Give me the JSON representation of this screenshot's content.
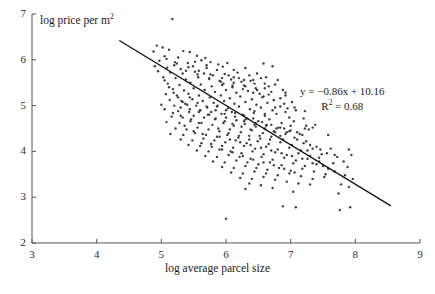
{
  "chart_data": {
    "type": "scatter",
    "title": "",
    "xlabel": "log average parcel size",
    "ylabel": "log price per m2",
    "ylabel_base": "log price per m",
    "ylabel_sup": "2",
    "xlim": [
      3,
      9
    ],
    "ylim": [
      2,
      7
    ],
    "xticks": [
      3,
      4,
      5,
      6,
      7,
      8,
      9
    ],
    "yticks": [
      2,
      3,
      4,
      5,
      6,
      7
    ],
    "grid": false,
    "legend": null,
    "marker_color": "#3e3e46",
    "marker_size_px": 2.4,
    "line_color": "#111111",
    "axis_color": "#555555",
    "annotations": {
      "equation": "y = −0.86x + 10.16",
      "r_squared_base": "R",
      "r_squared_sup": "2",
      "r_squared_value": " = 0.68",
      "slope": -0.86,
      "intercept": 10.16,
      "r2": 0.68
    },
    "fit_line": {
      "x_start": 4.35,
      "y_start": 6.42,
      "x_end": 8.55,
      "y_end": 2.81
    },
    "points": [
      [
        5.17,
        6.89
      ],
      [
        4.93,
        6.31
      ],
      [
        5.02,
        6.27
      ],
      [
        5.12,
        6.22
      ],
      [
        4.88,
        6.18
      ],
      [
        5.34,
        6.19
      ],
      [
        5.44,
        6.17
      ],
      [
        5.05,
        6.08
      ],
      [
        5.26,
        6.05
      ],
      [
        5.55,
        6.09
      ],
      [
        5.68,
        6.04
      ],
      [
        4.97,
        5.98
      ],
      [
        5.21,
        5.95
      ],
      [
        5.41,
        5.93
      ],
      [
        5.62,
        5.99
      ],
      [
        5.76,
        5.95
      ],
      [
        5.88,
        5.9
      ],
      [
        6.02,
        5.93
      ],
      [
        4.9,
        5.86
      ],
      [
        5.09,
        5.83
      ],
      [
        5.3,
        5.8
      ],
      [
        5.49,
        5.86
      ],
      [
        5.7,
        5.82
      ],
      [
        5.95,
        5.85
      ],
      [
        6.12,
        5.78
      ],
      [
        6.3,
        5.82
      ],
      [
        6.58,
        5.92
      ],
      [
        6.72,
        5.86
      ],
      [
        4.95,
        5.75
      ],
      [
        5.14,
        5.72
      ],
      [
        5.33,
        5.7
      ],
      [
        5.52,
        5.74
      ],
      [
        5.66,
        5.7
      ],
      [
        5.8,
        5.66
      ],
      [
        5.98,
        5.69
      ],
      [
        6.18,
        5.72
      ],
      [
        6.36,
        5.66
      ],
      [
        6.48,
        5.7
      ],
      [
        6.62,
        5.62
      ],
      [
        5.03,
        5.62
      ],
      [
        5.22,
        5.6
      ],
      [
        5.38,
        5.57
      ],
      [
        5.57,
        5.62
      ],
      [
        5.74,
        5.58
      ],
      [
        5.9,
        5.54
      ],
      [
        6.08,
        5.57
      ],
      [
        6.24,
        5.52
      ],
      [
        6.42,
        5.56
      ],
      [
        6.6,
        5.48
      ],
      [
        6.8,
        5.56
      ],
      [
        5.1,
        5.48
      ],
      [
        5.28,
        5.45
      ],
      [
        5.45,
        5.5
      ],
      [
        5.61,
        5.46
      ],
      [
        5.78,
        5.42
      ],
      [
        5.94,
        5.45
      ],
      [
        6.1,
        5.4
      ],
      [
        6.28,
        5.44
      ],
      [
        6.46,
        5.38
      ],
      [
        6.66,
        5.42
      ],
      [
        6.88,
        5.34
      ],
      [
        5.18,
        5.36
      ],
      [
        5.35,
        5.33
      ],
      [
        5.5,
        5.38
      ],
      [
        5.67,
        5.34
      ],
      [
        5.83,
        5.3
      ],
      [
        6.0,
        5.34
      ],
      [
        6.16,
        5.28
      ],
      [
        6.34,
        5.32
      ],
      [
        6.52,
        5.26
      ],
      [
        6.7,
        5.3
      ],
      [
        6.92,
        5.22
      ],
      [
        5.07,
        5.25
      ],
      [
        5.24,
        5.22
      ],
      [
        5.42,
        5.26
      ],
      [
        5.58,
        5.22
      ],
      [
        5.75,
        5.18
      ],
      [
        5.92,
        5.22
      ],
      [
        6.06,
        5.16
      ],
      [
        6.22,
        5.2
      ],
      [
        6.4,
        5.14
      ],
      [
        6.56,
        5.18
      ],
      [
        6.74,
        5.12
      ],
      [
        5.13,
        5.12
      ],
      [
        5.31,
        5.1
      ],
      [
        5.48,
        5.14
      ],
      [
        5.64,
        5.1
      ],
      [
        5.81,
        5.06
      ],
      [
        5.97,
        5.1
      ],
      [
        6.13,
        5.04
      ],
      [
        6.3,
        5.08
      ],
      [
        6.47,
        5.02
      ],
      [
        6.64,
        5.06
      ],
      [
        6.84,
        4.98
      ],
      [
        5.0,
        5.02
      ],
      [
        5.2,
        5.0
      ],
      [
        5.37,
        5.04
      ],
      [
        5.54,
        5.0
      ],
      [
        5.71,
        4.96
      ],
      [
        5.87,
        5.0
      ],
      [
        6.03,
        4.94
      ],
      [
        6.2,
        4.98
      ],
      [
        6.37,
        4.92
      ],
      [
        6.54,
        4.96
      ],
      [
        6.72,
        4.9
      ],
      [
        6.95,
        4.94
      ],
      [
        5.26,
        4.88
      ],
      [
        5.43,
        4.86
      ],
      [
        5.6,
        4.9
      ],
      [
        5.77,
        4.86
      ],
      [
        5.93,
        4.82
      ],
      [
        6.09,
        4.86
      ],
      [
        6.26,
        4.8
      ],
      [
        6.43,
        4.84
      ],
      [
        6.6,
        4.78
      ],
      [
        6.78,
        4.82
      ],
      [
        6.98,
        4.74
      ],
      [
        5.16,
        4.76
      ],
      [
        5.33,
        4.74
      ],
      [
        5.5,
        4.78
      ],
      [
        5.66,
        4.74
      ],
      [
        5.83,
        4.7
      ],
      [
        6.0,
        4.74
      ],
      [
        6.16,
        4.68
      ],
      [
        6.33,
        4.72
      ],
      [
        6.5,
        4.66
      ],
      [
        6.67,
        4.7
      ],
      [
        6.86,
        4.62
      ],
      [
        7.05,
        4.66
      ],
      [
        5.08,
        4.64
      ],
      [
        5.28,
        4.62
      ],
      [
        5.45,
        4.66
      ],
      [
        5.62,
        4.62
      ],
      [
        5.79,
        4.58
      ],
      [
        5.96,
        4.62
      ],
      [
        6.12,
        4.56
      ],
      [
        6.29,
        4.6
      ],
      [
        6.46,
        4.54
      ],
      [
        6.63,
        4.58
      ],
      [
        6.81,
        4.52
      ],
      [
        7.0,
        4.56
      ],
      [
        7.22,
        4.5
      ],
      [
        7.34,
        4.52
      ],
      [
        5.22,
        4.5
      ],
      [
        5.39,
        4.48
      ],
      [
        5.56,
        4.52
      ],
      [
        5.73,
        4.48
      ],
      [
        5.9,
        4.44
      ],
      [
        6.06,
        4.48
      ],
      [
        6.23,
        4.42
      ],
      [
        6.4,
        4.46
      ],
      [
        6.57,
        4.4
      ],
      [
        6.74,
        4.44
      ],
      [
        6.92,
        4.38
      ],
      [
        7.1,
        4.42
      ],
      [
        7.28,
        4.48
      ],
      [
        5.14,
        4.38
      ],
      [
        5.34,
        4.36
      ],
      [
        5.52,
        4.4
      ],
      [
        5.69,
        4.36
      ],
      [
        5.86,
        4.32
      ],
      [
        6.02,
        4.36
      ],
      [
        6.19,
        4.3
      ],
      [
        6.36,
        4.34
      ],
      [
        6.53,
        4.28
      ],
      [
        6.7,
        4.32
      ],
      [
        6.88,
        4.26
      ],
      [
        7.06,
        4.3
      ],
      [
        7.24,
        4.22
      ],
      [
        7.58,
        4.36
      ],
      [
        5.3,
        4.26
      ],
      [
        5.48,
        4.24
      ],
      [
        5.65,
        4.28
      ],
      [
        5.82,
        4.24
      ],
      [
        5.99,
        4.2
      ],
      [
        6.15,
        4.24
      ],
      [
        6.32,
        4.18
      ],
      [
        6.49,
        4.22
      ],
      [
        6.66,
        4.16
      ],
      [
        6.84,
        4.2
      ],
      [
        7.02,
        4.14
      ],
      [
        7.2,
        4.18
      ],
      [
        7.4,
        4.1
      ],
      [
        7.62,
        4.06
      ],
      [
        7.9,
        4.04
      ],
      [
        5.42,
        4.14
      ],
      [
        5.6,
        4.12
      ],
      [
        5.77,
        4.16
      ],
      [
        5.94,
        4.12
      ],
      [
        6.11,
        4.08
      ],
      [
        6.28,
        4.12
      ],
      [
        6.45,
        4.06
      ],
      [
        6.62,
        4.1
      ],
      [
        6.8,
        4.04
      ],
      [
        6.98,
        4.08
      ],
      [
        7.16,
        4.02
      ],
      [
        7.34,
        4.06
      ],
      [
        7.56,
        3.96
      ],
      [
        5.55,
        4.02
      ],
      [
        5.73,
        4.0
      ],
      [
        5.9,
        4.04
      ],
      [
        6.07,
        4.0
      ],
      [
        6.24,
        3.96
      ],
      [
        6.41,
        4.0
      ],
      [
        6.58,
        3.94
      ],
      [
        6.76,
        3.98
      ],
      [
        6.94,
        3.92
      ],
      [
        7.12,
        3.96
      ],
      [
        7.3,
        3.9
      ],
      [
        7.48,
        3.94
      ],
      [
        7.72,
        3.88
      ],
      [
        7.94,
        3.92
      ],
      [
        5.68,
        3.9
      ],
      [
        5.86,
        3.88
      ],
      [
        6.04,
        3.92
      ],
      [
        6.21,
        3.88
      ],
      [
        6.38,
        3.84
      ],
      [
        6.55,
        3.88
      ],
      [
        6.72,
        3.82
      ],
      [
        6.9,
        3.86
      ],
      [
        7.08,
        3.8
      ],
      [
        7.26,
        3.84
      ],
      [
        7.44,
        3.78
      ],
      [
        7.66,
        3.74
      ],
      [
        5.8,
        3.78
      ],
      [
        5.98,
        3.76
      ],
      [
        6.16,
        3.8
      ],
      [
        6.33,
        3.76
      ],
      [
        6.5,
        3.72
      ],
      [
        6.68,
        3.76
      ],
      [
        6.86,
        3.7
      ],
      [
        7.04,
        3.74
      ],
      [
        7.22,
        3.68
      ],
      [
        7.4,
        3.72
      ],
      [
        7.58,
        3.62
      ],
      [
        7.88,
        3.66
      ],
      [
        5.94,
        3.66
      ],
      [
        6.12,
        3.64
      ],
      [
        6.3,
        3.68
      ],
      [
        6.47,
        3.64
      ],
      [
        6.64,
        3.6
      ],
      [
        6.82,
        3.64
      ],
      [
        7.0,
        3.58
      ],
      [
        7.18,
        3.62
      ],
      [
        7.36,
        3.56
      ],
      [
        7.54,
        3.5
      ],
      [
        6.08,
        3.54
      ],
      [
        6.26,
        3.52
      ],
      [
        6.44,
        3.56
      ],
      [
        6.62,
        3.52
      ],
      [
        6.8,
        3.48
      ],
      [
        6.98,
        3.52
      ],
      [
        7.16,
        3.46
      ],
      [
        7.34,
        3.4
      ],
      [
        7.52,
        3.44
      ],
      [
        7.78,
        3.28
      ],
      [
        6.22,
        3.42
      ],
      [
        6.4,
        3.4
      ],
      [
        6.58,
        3.44
      ],
      [
        6.76,
        3.38
      ],
      [
        6.94,
        3.34
      ],
      [
        7.12,
        3.3
      ],
      [
        7.3,
        3.28
      ],
      [
        7.9,
        3.22
      ],
      [
        6.36,
        3.3
      ],
      [
        6.54,
        3.26
      ],
      [
        6.72,
        3.2
      ],
      [
        7.04,
        3.12
      ],
      [
        7.74,
        3.08
      ],
      [
        6.88,
        2.8
      ],
      [
        7.76,
        2.72
      ],
      [
        7.92,
        2.78
      ],
      [
        6.0,
        2.53
      ],
      [
        5.05,
        5.55
      ],
      [
        5.12,
        5.4
      ],
      [
        5.19,
        5.28
      ],
      [
        5.26,
        5.18
      ],
      [
        5.33,
        5.08
      ],
      [
        5.4,
        5.02
      ],
      [
        5.05,
        4.92
      ],
      [
        5.18,
        4.84
      ],
      [
        5.3,
        4.78
      ],
      [
        5.46,
        4.7
      ],
      [
        5.58,
        4.62
      ],
      [
        5.36,
        4.56
      ],
      [
        5.5,
        4.44
      ],
      [
        5.64,
        4.38
      ],
      [
        5.88,
        4.5
      ],
      [
        6.04,
        4.4
      ],
      [
        6.2,
        4.34
      ],
      [
        6.36,
        4.26
      ],
      [
        6.52,
        4.34
      ],
      [
        6.68,
        4.26
      ],
      [
        6.84,
        4.34
      ],
      [
        7.0,
        4.46
      ],
      [
        7.18,
        4.36
      ],
      [
        7.3,
        4.14
      ],
      [
        6.44,
        4.58
      ],
      [
        6.6,
        4.5
      ],
      [
        6.76,
        4.42
      ],
      [
        6.9,
        4.5
      ],
      [
        6.28,
        4.66
      ],
      [
        6.44,
        4.88
      ],
      [
        6.6,
        4.82
      ],
      [
        6.76,
        4.96
      ],
      [
        6.92,
        4.86
      ],
      [
        7.08,
        4.9
      ],
      [
        7.2,
        4.72
      ],
      [
        5.96,
        5.48
      ],
      [
        6.12,
        5.62
      ],
      [
        6.28,
        5.56
      ],
      [
        6.44,
        5.48
      ],
      [
        6.6,
        5.38
      ],
      [
        6.76,
        5.46
      ],
      [
        6.92,
        5.28
      ],
      [
        5.52,
        5.96
      ],
      [
        5.7,
        5.88
      ],
      [
        5.86,
        5.78
      ],
      [
        6.04,
        5.66
      ],
      [
        6.2,
        5.6
      ],
      [
        6.38,
        5.54
      ],
      [
        6.54,
        5.6
      ],
      [
        5.6,
        4.9
      ],
      [
        5.72,
        4.8
      ],
      [
        5.84,
        4.72
      ],
      [
        5.98,
        4.66
      ],
      [
        6.1,
        4.6
      ],
      [
        6.24,
        4.54
      ],
      [
        6.38,
        4.48
      ],
      [
        5.44,
        5.18
      ],
      [
        5.56,
        5.06
      ],
      [
        5.7,
        4.98
      ],
      [
        5.84,
        4.9
      ],
      [
        5.98,
        4.82
      ],
      [
        6.14,
        4.76
      ],
      [
        6.3,
        4.7
      ],
      [
        6.46,
        4.62
      ],
      [
        6.62,
        4.56
      ],
      [
        6.78,
        4.5
      ],
      [
        6.94,
        4.42
      ],
      [
        7.1,
        4.26
      ],
      [
        7.26,
        4.02
      ],
      [
        7.44,
        3.86
      ],
      [
        5.9,
        4.32
      ],
      [
        6.06,
        4.26
      ],
      [
        6.22,
        4.2
      ],
      [
        6.38,
        4.14
      ],
      [
        6.54,
        4.08
      ],
      [
        6.7,
        4.02
      ],
      [
        6.86,
        3.96
      ],
      [
        7.02,
        3.9
      ],
      [
        7.18,
        3.84
      ],
      [
        7.34,
        3.74
      ],
      [
        7.5,
        3.68
      ],
      [
        7.68,
        3.56
      ],
      [
        7.84,
        3.48
      ],
      [
        7.96,
        3.4
      ],
      [
        5.2,
        5.88
      ],
      [
        5.38,
        5.76
      ],
      [
        5.56,
        5.68
      ],
      [
        5.74,
        5.6
      ],
      [
        5.92,
        5.52
      ],
      [
        6.1,
        5.44
      ],
      [
        6.26,
        5.36
      ],
      [
        6.42,
        5.28
      ],
      [
        6.58,
        5.2
      ],
      [
        6.74,
        5.12
      ],
      [
        6.9,
        5.04
      ],
      [
        7.06,
        4.96
      ],
      [
        7.22,
        4.88
      ],
      [
        7.38,
        4.58
      ],
      [
        5.08,
        6.02
      ],
      [
        5.24,
        5.92
      ],
      [
        5.42,
        5.84
      ],
      [
        5.58,
        5.76
      ],
      [
        5.76,
        5.68
      ],
      [
        5.94,
        5.6
      ],
      [
        6.12,
        5.5
      ],
      [
        6.3,
        5.42
      ],
      [
        6.48,
        5.34
      ],
      [
        6.66,
        5.24
      ],
      [
        6.84,
        5.16
      ],
      [
        7.02,
        5.08
      ],
      [
        7.24,
        4.56
      ],
      [
        7.46,
        4.04
      ],
      [
        5.86,
        4.98
      ],
      [
        6.0,
        4.9
      ],
      [
        6.14,
        4.84
      ],
      [
        6.28,
        4.78
      ],
      [
        6.42,
        4.72
      ],
      [
        6.56,
        4.64
      ],
      [
        6.7,
        4.58
      ],
      [
        6.84,
        4.52
      ],
      [
        6.98,
        4.44
      ],
      [
        7.14,
        4.38
      ],
      [
        5.3,
        4.96
      ],
      [
        5.44,
        4.92
      ],
      [
        5.58,
        4.86
      ],
      [
        5.74,
        4.8
      ],
      [
        5.62,
        4.18
      ],
      [
        5.78,
        4.1
      ],
      [
        5.94,
        4.04
      ],
      [
        6.1,
        3.98
      ],
      [
        6.26,
        3.9
      ],
      [
        6.42,
        3.82
      ],
      [
        6.58,
        3.76
      ],
      [
        6.74,
        3.7
      ],
      [
        6.9,
        3.62
      ],
      [
        7.06,
        3.54
      ],
      [
        6.3,
        3.18
      ],
      [
        7.08,
        2.78
      ],
      [
        7.68,
        3.92
      ],
      [
        7.82,
        3.78
      ]
    ]
  }
}
